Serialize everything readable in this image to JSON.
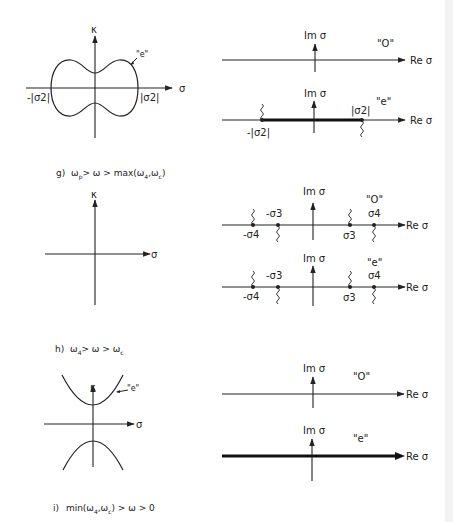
{
  "colors": {
    "ink": "#222222",
    "background": "#ffffff"
  },
  "sections": [
    {
      "id": "g",
      "caption": "g)  ω  > ω > max (ω  , ω  )",
      "caption_parts": {
        "prefix": "g)",
        "text": "ωp > ω > max(ω4, ωc)"
      },
      "kappa_plot": {
        "y_axis_label": "κ",
        "x_axis_label": "σ",
        "curve_label": "\"e\"",
        "left_intercept": "-|σ2|",
        "right_intercept": "|σ2|"
      },
      "sigma_plots": [
        {
          "parity": "\"O\"",
          "im_label": "Im σ",
          "re_label": "Re σ",
          "markers": []
        },
        {
          "parity": "\"e\"",
          "im_label": "Im σ",
          "re_label": "Re σ",
          "markers": [
            {
              "label": "-|σ2|"
            },
            {
              "label": "|σ2|"
            }
          ],
          "thick_segment": "between -|σ2| and |σ2|"
        }
      ]
    },
    {
      "id": "h",
      "caption": "h)  ω4 > ω > ωc",
      "kappa_plot": {
        "y_axis_label": "κ",
        "x_axis_label": "σ"
      },
      "sigma_plots": [
        {
          "parity": "\"O\"",
          "im_label": "Im σ",
          "re_label": "Re σ",
          "markers": [
            {
              "label": "-σ4"
            },
            {
              "label": "-σ3"
            },
            {
              "label": "σ3"
            },
            {
              "label": "σ4"
            }
          ]
        },
        {
          "parity": "\"e\"",
          "im_label": "Im σ",
          "re_label": "Re σ",
          "markers": [
            {
              "label": "-σ4"
            },
            {
              "label": "-σ3"
            },
            {
              "label": "σ3"
            },
            {
              "label": "σ4"
            }
          ]
        }
      ]
    },
    {
      "id": "i",
      "caption": "i)  min(ω4, ωc) > ω > 0",
      "kappa_plot": {
        "y_axis_label": "κ",
        "x_axis_label": "σ",
        "curve_label": "\"e\""
      },
      "sigma_plots": [
        {
          "parity": "\"O\"",
          "im_label": "Im σ",
          "re_label": "Re σ",
          "markers": []
        },
        {
          "parity": "\"e\"",
          "im_label": "Im σ",
          "re_label": "Re σ",
          "markers": [],
          "thick_segment": "entire real axis"
        }
      ]
    }
  ],
  "labels": {
    "kappa": "κ",
    "sigma": "σ",
    "im_sigma": "Im σ",
    "re_sigma": "Re σ",
    "odd": "\"O\"",
    "even": "\"e\"",
    "neg_abs_sigma2": "-|σ2|",
    "abs_sigma2": "|σ2|",
    "neg_sigma3": "-σ3",
    "neg_sigma4": "-σ4",
    "sigma3": "σ3",
    "sigma4": "σ4",
    "cap_g": {
      "a": "g)",
      "b": "ω",
      "c": "p",
      "d": "> ω > max(ω",
      "e": "4",
      "f": ",ω",
      "g": "c",
      "h": ")"
    },
    "cap_h": {
      "a": "h)",
      "b": "ω",
      "c": "4",
      "d": "> ω > ω",
      "e": "c"
    },
    "cap_i": {
      "a": "i)",
      "b": "min(ω",
      "c": "4",
      "d": ",ω",
      "e": "c",
      "f": ") > ω > 0"
    }
  }
}
